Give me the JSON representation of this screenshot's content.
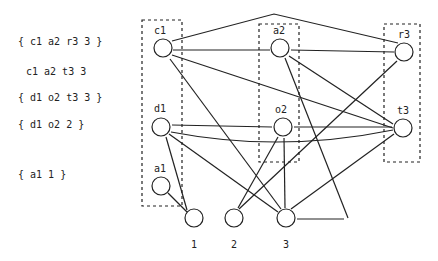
{
  "set_labels": [
    {
      "text": "{ c1 a2 r3 3 }",
      "x": 18,
      "y": 43
    },
    {
      "text": "c1 a2 t3 3",
      "x": 26,
      "y": 73
    },
    {
      "text": "{ d1 o2 t3 3 }",
      "x": 18,
      "y": 99
    },
    {
      "text": "{ d1 o2 2 }",
      "x": 18,
      "y": 126
    },
    {
      "text": "{ a1 1 }",
      "x": 18,
      "y": 176
    }
  ],
  "nodes": {
    "c1": {
      "label": "c1",
      "x": 163,
      "y": 48
    },
    "a2": {
      "label": "a2",
      "x": 280,
      "y": 48
    },
    "r3": {
      "label": "r3",
      "x": 404,
      "y": 52
    },
    "d1": {
      "label": "d1",
      "x": 161,
      "y": 127
    },
    "o2": {
      "label": "o2",
      "x": 283,
      "y": 127
    },
    "t3": {
      "label": "t3",
      "x": 403,
      "y": 128
    },
    "a1": {
      "label": "a1",
      "x": 161,
      "y": 186
    },
    "n1": {
      "label": "1",
      "x": 194,
      "y": 218
    },
    "n2": {
      "label": "2",
      "x": 234,
      "y": 218
    },
    "n3": {
      "label": "3",
      "x": 286,
      "y": 218
    }
  },
  "bottom_labels": [
    {
      "text": "1",
      "x": 194,
      "y": 248
    },
    {
      "text": "2",
      "x": 234,
      "y": 248
    },
    {
      "text": "3",
      "x": 286,
      "y": 248
    }
  ],
  "colors": {
    "stroke": "#222222",
    "background": "#ffffff"
  }
}
